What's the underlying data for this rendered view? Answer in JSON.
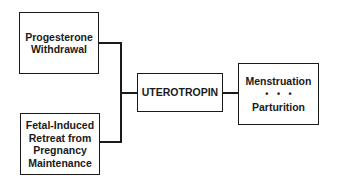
{
  "diagram": {
    "inputs": [
      {
        "id": "progesterone",
        "lines": [
          "Progesterone",
          "Withdrawal"
        ]
      },
      {
        "id": "fetal",
        "lines": [
          "Fetal-Induced",
          "Retreat from",
          "Pregnancy",
          "Maintenance"
        ]
      }
    ],
    "center": {
      "label": "UTEROTROPIN"
    },
    "outcome": {
      "top": "Menstruation",
      "separator": "• • •",
      "bottom": "Parturition"
    },
    "colors": {
      "stroke": "#1a1a1a",
      "background": "#ffffff"
    }
  }
}
